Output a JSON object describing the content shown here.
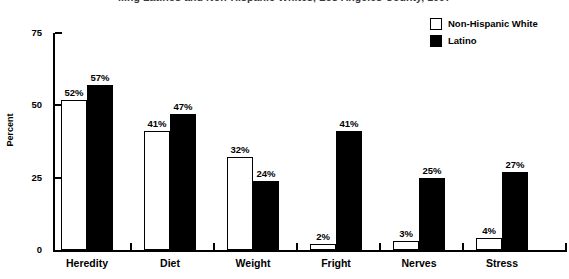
{
  "chart_data": {
    "type": "bar",
    "title": "...ng Latinos and Non-Hispanic Whites, Los Angeles County, 1997",
    "xlabel": "",
    "ylabel": "Percent",
    "ylim": [
      0,
      75
    ],
    "yticks": [
      0,
      25,
      50,
      75
    ],
    "ytick_labels": [
      "0",
      "25",
      "50",
      "75"
    ],
    "grid": false,
    "legend_position": "top-right",
    "categories": [
      "Heredity",
      "Diet",
      "Weight",
      "Fright",
      "Nerves",
      "Stress"
    ],
    "series": [
      {
        "name": "Non-Hispanic White",
        "color": "#ffffff",
        "edge_color": "#000000",
        "values": [
          52,
          41,
          32,
          2,
          3,
          4
        ],
        "value_labels": [
          "52%",
          "41%",
          "32%",
          "2%",
          "3%",
          "4%"
        ]
      },
      {
        "name": "Latino",
        "color": "#000000",
        "edge_color": "#000000",
        "values": [
          57,
          47,
          24,
          41,
          25,
          27
        ],
        "value_labels": [
          "57%",
          "47%",
          "24%",
          "41%",
          "25%",
          "27%"
        ]
      }
    ]
  },
  "legend": {
    "items": [
      {
        "label": "Non-Hispanic White",
        "swatch": "white"
      },
      {
        "label": "Latino",
        "swatch": "black"
      }
    ]
  }
}
